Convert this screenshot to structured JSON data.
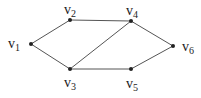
{
  "diagram": {
    "type": "undirected-graph",
    "nodes": [
      {
        "id": "v1",
        "base": "v",
        "sub": "1",
        "x": 31,
        "y": 44,
        "lx": 8,
        "ly": 37
      },
      {
        "id": "v2",
        "base": "v",
        "sub": "2",
        "x": 70,
        "y": 20,
        "lx": 64,
        "ly": 3
      },
      {
        "id": "v3",
        "base": "v",
        "sub": "3",
        "x": 70,
        "y": 69,
        "lx": 64,
        "ly": 76
      },
      {
        "id": "v4",
        "base": "v",
        "sub": "4",
        "x": 131,
        "y": 21,
        "lx": 126,
        "ly": 4
      },
      {
        "id": "v5",
        "base": "v",
        "sub": "5",
        "x": 131,
        "y": 69,
        "lx": 126,
        "ly": 77
      },
      {
        "id": "v6",
        "base": "v",
        "sub": "6",
        "x": 173,
        "y": 46,
        "lx": 182,
        "ly": 40
      }
    ],
    "edges": [
      [
        "v1",
        "v2"
      ],
      [
        "v1",
        "v3"
      ],
      [
        "v2",
        "v4"
      ],
      [
        "v3",
        "v4"
      ],
      [
        "v3",
        "v5"
      ],
      [
        "v4",
        "v6"
      ],
      [
        "v5",
        "v6"
      ]
    ],
    "colors": {
      "edge": "#555555",
      "node": "#222222",
      "label": "#222222"
    }
  }
}
